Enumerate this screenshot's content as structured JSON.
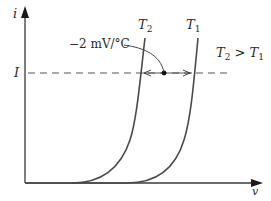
{
  "diagram": {
    "type": "diode i-v characteristic vs temperature",
    "axes": {
      "y_label": "i",
      "x_label": "v"
    },
    "current_level": {
      "label": "I"
    },
    "curves": [
      {
        "name": "T2",
        "label_main": "T",
        "label_sub": "2"
      },
      {
        "name": "T1",
        "label_main": "T",
        "label_sub": "1"
      }
    ],
    "annotation": {
      "text": "−2 mV/°C"
    },
    "relation": {
      "left_main": "T",
      "left_sub": "2",
      "operator": " > ",
      "right_main": "T",
      "right_sub": "1"
    },
    "colors": {
      "line": "#3a3a3a",
      "curve": "#4a4a4a",
      "dashed": "#555555",
      "text": "#2a2a2a"
    }
  }
}
